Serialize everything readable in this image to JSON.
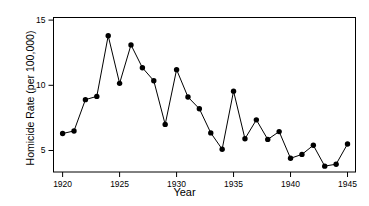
{
  "chart_data": {
    "type": "line",
    "title": "",
    "xlabel": "Year",
    "ylabel": "Homicide Rate (per 100,000)",
    "xlim": [
      1919.2,
      1945.7
    ],
    "ylim": [
      3.35,
      15.2
    ],
    "xticks": [
      1920,
      1925,
      1930,
      1935,
      1940,
      1945
    ],
    "xtick_labels": [
      "1920",
      "1925",
      "1930",
      "1935",
      "1940",
      "1945"
    ],
    "yticks": [
      5,
      10,
      15
    ],
    "ytick_labels": [
      "5",
      "10",
      "15"
    ],
    "grid": false,
    "legend": null,
    "marker": "filled-circle",
    "marker_color": "#000000",
    "line_color": "#000000",
    "x": [
      1920,
      1921,
      1922,
      1923,
      1924,
      1925,
      1926,
      1927,
      1928,
      1929,
      1930,
      1931,
      1932,
      1933,
      1934,
      1935,
      1936,
      1937,
      1938,
      1939,
      1940,
      1941,
      1942,
      1943,
      1944,
      1945
    ],
    "values": [
      6.3,
      6.5,
      8.9,
      9.15,
      13.8,
      10.15,
      13.1,
      11.35,
      10.35,
      7.0,
      11.2,
      9.1,
      8.2,
      6.35,
      5.1,
      9.55,
      5.9,
      7.35,
      5.85,
      6.45,
      4.4,
      4.7,
      5.4,
      3.8,
      3.95,
      5.5
    ]
  },
  "axes": {
    "x_title": "Year",
    "y_title": "Homicide Rate (per 100,000)"
  }
}
